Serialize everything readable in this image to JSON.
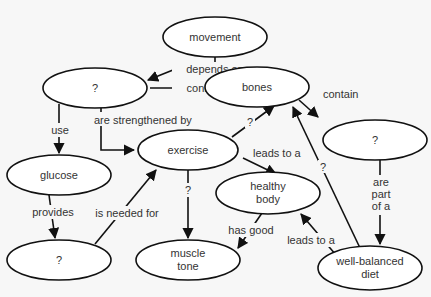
{
  "diagram": {
    "type": "concept-map",
    "nodes": {
      "movement": {
        "label": "movement"
      },
      "unknown_top_left": {
        "label": "?"
      },
      "bones": {
        "label": "bones"
      },
      "unknown_right": {
        "label": "?"
      },
      "exercise": {
        "label": "exercise"
      },
      "glucose": {
        "label": "glucose"
      },
      "healthy_body": {
        "line1": "healthy",
        "line2": "body"
      },
      "unknown_bottom_left": {
        "label": "?"
      },
      "muscle_tone": {
        "line1": "muscle",
        "line2": "tone"
      },
      "well_balanced_diet": {
        "line1": "well-balanced",
        "line2": "diet"
      }
    },
    "edges": {
      "depends_on": {
        "label": "depends on",
        "from": "movement",
        "to": [
          "?",
          "bones"
        ]
      },
      "connect_to": {
        "label": "connect to",
        "from": "?",
        "to": "bones"
      },
      "contain": {
        "label": "contain",
        "from": "bones",
        "to": "?"
      },
      "use": {
        "label": "use",
        "from": "?",
        "to": "glucose"
      },
      "are_strengthened_by": {
        "label": "are strengthened by",
        "from": "?",
        "to": "exercise"
      },
      "exercise_to_bones": {
        "label": "?",
        "from": "exercise",
        "to": "bones"
      },
      "leads_to_a_1": {
        "label": "leads to a",
        "from": "exercise",
        "to": "healthy body"
      },
      "exercise_to_muscle": {
        "label": "?",
        "from": "exercise",
        "to": "muscle tone"
      },
      "provides": {
        "label": "provides",
        "from": "glucose",
        "to": "?"
      },
      "is_needed_for": {
        "label": "is needed for",
        "from": "?",
        "to": "exercise"
      },
      "has_good": {
        "label": "has good",
        "from": "healthy body",
        "to": "muscle tone"
      },
      "leads_to_a_2": {
        "label": "leads to a",
        "from": "well-balanced diet",
        "to": "healthy body"
      },
      "diet_to_bones": {
        "label": "?",
        "from": "well-balanced diet",
        "to": "bones"
      },
      "are_part_of_a": {
        "line1": "are",
        "line2": "part",
        "line3": "of a",
        "from": "?",
        "to": "well-balanced diet"
      }
    }
  }
}
